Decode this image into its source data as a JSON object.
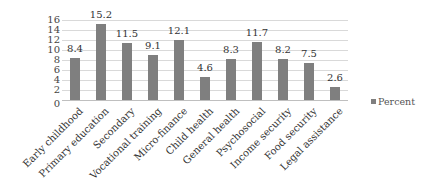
{
  "chart_data": {
    "type": "bar",
    "title": "",
    "xlabel": "",
    "ylabel": "",
    "ylim": [
      0,
      16
    ],
    "yticks": [
      0,
      2,
      4,
      6,
      8,
      10,
      12,
      14,
      16
    ],
    "grid": true,
    "legend_position": "right",
    "categories": [
      "Early childhood",
      "Primary education",
      "Secondary",
      "Vocational training",
      "Micro-finance",
      "Child health",
      "General health",
      "Psychosocial",
      "Income security",
      "Food security",
      "Legal assistance"
    ],
    "series": [
      {
        "name": "Percent",
        "color": "#7f7f7f",
        "values": [
          8.4,
          15.2,
          11.5,
          9.1,
          12.1,
          4.6,
          8.3,
          11.7,
          8.2,
          7.5,
          2.6
        ],
        "labels": [
          "8.4",
          "15.2",
          "11.5",
          "9.1",
          "12.1",
          "4.6",
          "8.3",
          "11.7",
          "8.2",
          "7.5",
          "2.6"
        ]
      }
    ]
  },
  "legend": {
    "label": "Percent"
  }
}
